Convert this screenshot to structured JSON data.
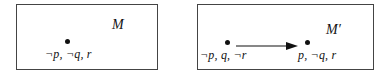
{
  "models": [
    {
      "name": "M",
      "worlds": [
        {
          "label": "¬p, ¬q, r"
        }
      ],
      "edges": []
    },
    {
      "name": "M′",
      "worlds": [
        {
          "label": "¬p, q, ¬r"
        },
        {
          "label": "p, ¬q, r"
        }
      ],
      "edges": [
        {
          "from": 0,
          "to": 1,
          "type": "arrow"
        }
      ]
    }
  ]
}
